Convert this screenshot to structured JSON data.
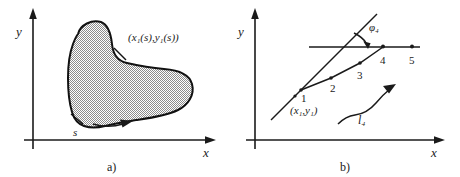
{
  "figure": {
    "caption_a": "a)",
    "caption_b": "b)",
    "panel_a": {
      "axis_x_label": "x",
      "axis_y_label": "y",
      "curve_point_label": "(x₁(s),y₁(s))",
      "arclength_label": "s",
      "region_fill": "#9a9a9a",
      "region_description": "closed shaded region with smooth boundary",
      "orientation_arrow": "counterclockwise-boundary-arrow"
    },
    "panel_b": {
      "axis_x_label": "x",
      "axis_y_label": "y",
      "angle_label": "φ₄",
      "start_point_label": "(x₁,y₁)",
      "segment_label": "l₄",
      "node_labels": [
        "1",
        "2",
        "3",
        "4",
        "5"
      ],
      "horizontal_ray": "reference horizontal line through node 4",
      "diagonal_ray": "straight line through start point"
    },
    "colors": {
      "ink": "#1a1a1a",
      "background": "#ffffff",
      "shade": "#9a9a9a"
    }
  }
}
